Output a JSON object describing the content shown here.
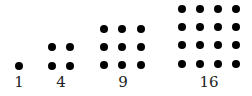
{
  "groups": [
    {
      "label": "1",
      "n": 1,
      "xs": [
        19
      ],
      "ys": [
        66
      ],
      "label_x": 19
    },
    {
      "label": "4",
      "n": 2,
      "xs": [
        52,
        70
      ],
      "ys": [
        47,
        66
      ],
      "label_x": 61
    },
    {
      "label": "9",
      "n": 3,
      "xs": [
        104,
        122,
        141
      ],
      "ys": [
        29,
        47,
        65
      ],
      "label_x": 123
    },
    {
      "label": "16",
      "n": 4,
      "xs": [
        182,
        200,
        218,
        236
      ],
      "ys": [
        9,
        27,
        45,
        64
      ],
      "label_x": 209
    }
  ],
  "colors": {
    "dot": "#000000",
    "label": "#222222",
    "background": "#ffffff"
  }
}
